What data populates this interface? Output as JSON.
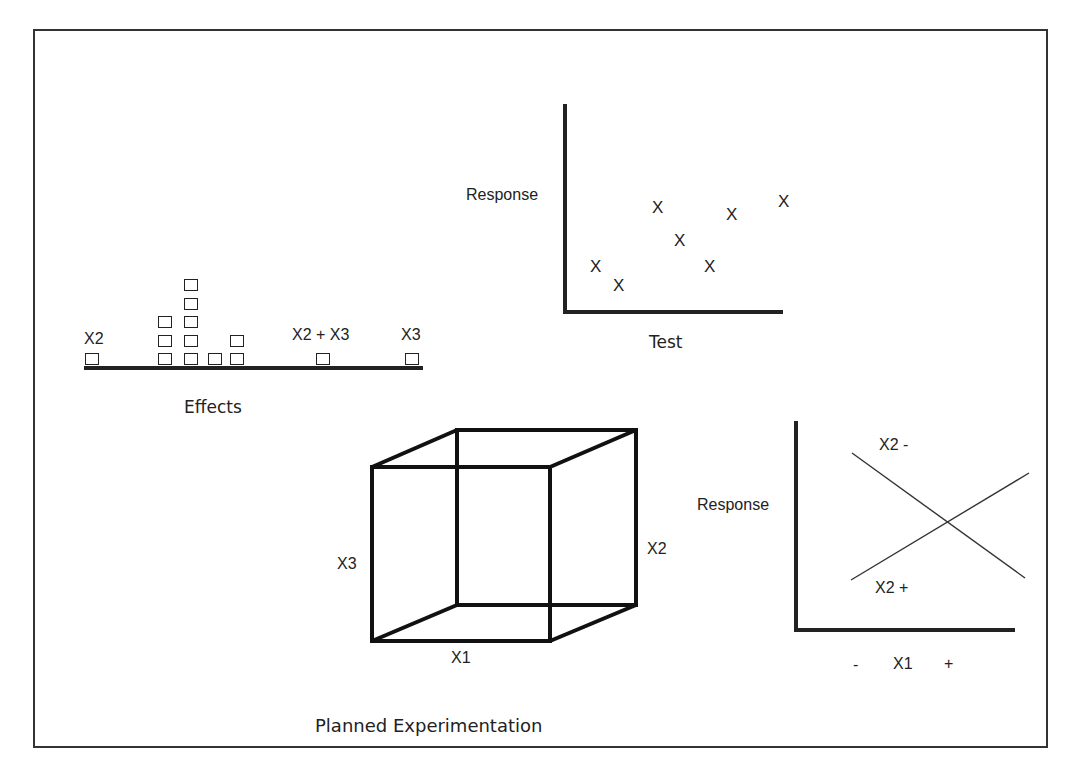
{
  "title": "Planned Experimentation",
  "effects_panel": {
    "caption": "Effects",
    "labels": {
      "left": "X2",
      "middle": "X2 + X3",
      "right": "X3"
    },
    "columns": [
      {
        "x": 85,
        "count": 1
      },
      {
        "x": 158,
        "count": 3
      },
      {
        "x": 184,
        "count": 5
      },
      {
        "x": 208,
        "count": 1
      },
      {
        "x": 230,
        "count": 2
      },
      {
        "x": 316,
        "count": 1
      },
      {
        "x": 405,
        "count": 1
      }
    ]
  },
  "scatter_panel": {
    "ylabel": "Response",
    "xlabel": "Test",
    "marker": "X"
  },
  "cube_panel": {
    "labels": {
      "x1": "X1",
      "x2": "X2",
      "x3": "X3"
    }
  },
  "interaction_panel": {
    "ylabel": "Response",
    "x_minus": "-",
    "x_label": "X1",
    "x_plus": "+",
    "line_top_label": "X2  -",
    "line_bottom_label": "X2  +"
  },
  "chart_data": [
    {
      "type": "bar",
      "title": "Effects",
      "xlabel": "Effects",
      "categories": [
        "X2",
        "e1",
        "e2",
        "e3",
        "e4",
        "X2 + X3",
        "X3"
      ],
      "values": [
        1,
        3,
        5,
        1,
        2,
        1,
        1
      ]
    },
    {
      "type": "scatter",
      "xlabel": "Test",
      "ylabel": "Response",
      "x": [
        1,
        2,
        3,
        4,
        5,
        6,
        7
      ],
      "y": [
        3.5,
        2,
        8,
        5.5,
        3.5,
        7.5,
        8.5
      ]
    },
    {
      "type": "line",
      "xlabel": "X1",
      "ylabel": "Response",
      "categories": [
        "-",
        "+"
      ],
      "series": [
        {
          "name": "X2 -",
          "values": [
            8,
            2
          ]
        },
        {
          "name": "X2 +",
          "values": [
            2,
            7
          ]
        }
      ]
    }
  ]
}
